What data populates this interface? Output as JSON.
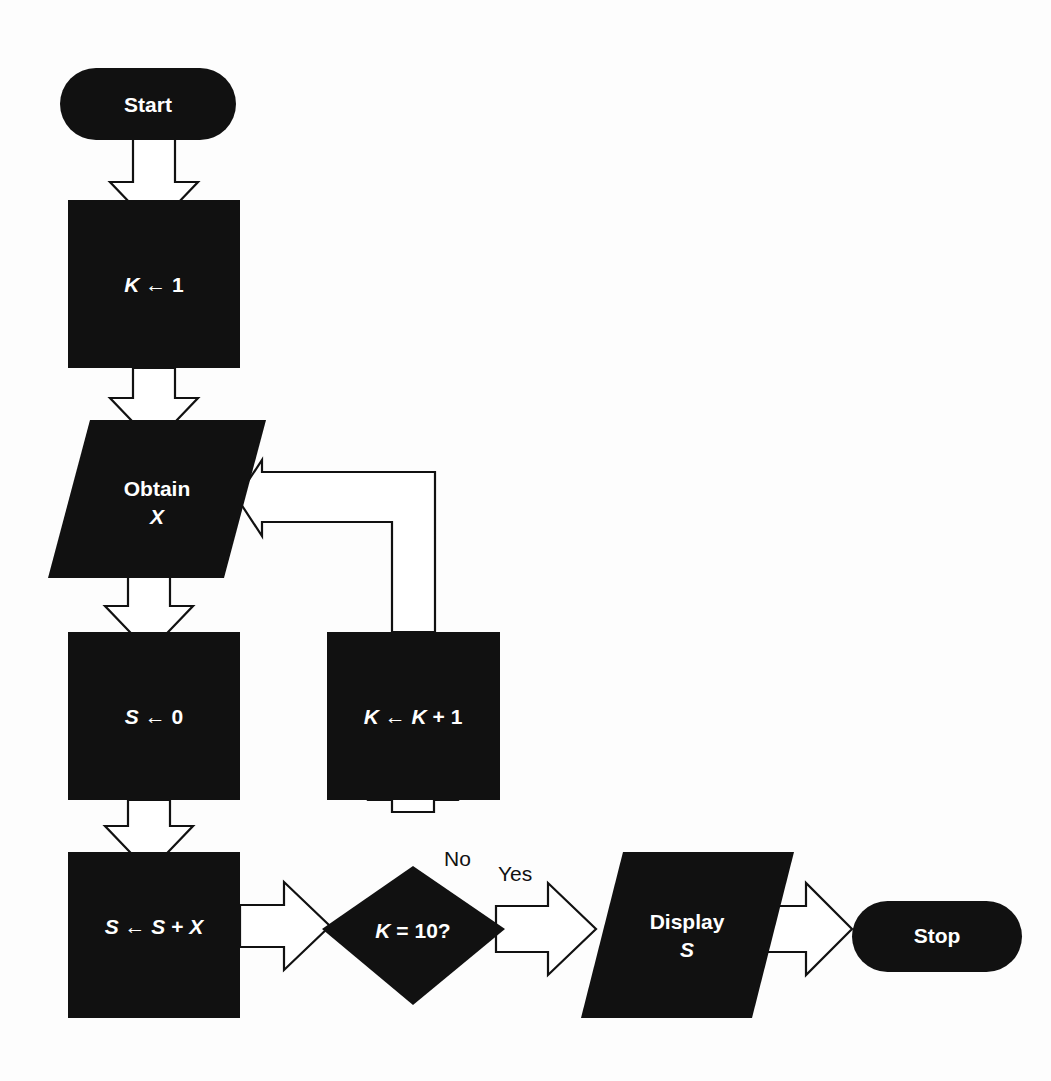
{
  "diagram": {
    "background_color": "#fdfdfd",
    "shape_fill": "#111111",
    "label_color": "#ffffff",
    "connector_stroke": "#111111",
    "connector_fill": "#ffffff"
  },
  "nodes": {
    "start": {
      "label": "Start",
      "shape": "terminator"
    },
    "init_k": {
      "label": "K ← 1",
      "shape": "process"
    },
    "obtain_x": {
      "label_line1": "Obtain",
      "label_line2": "X",
      "shape": "input-output"
    },
    "init_s": {
      "label": "S ← 0",
      "shape": "process"
    },
    "increment_k": {
      "label": "K ← K + 1",
      "shape": "process"
    },
    "accumulate": {
      "label": "S ← S + X",
      "shape": "process"
    },
    "decision": {
      "label": "K = 10?",
      "shape": "decision"
    },
    "display_s": {
      "label_line1": "Display",
      "label_line2": "S",
      "shape": "input-output"
    },
    "stop": {
      "label": "Stop",
      "shape": "terminator"
    }
  },
  "edges": {
    "no_label": "No",
    "yes_label": "Yes"
  }
}
